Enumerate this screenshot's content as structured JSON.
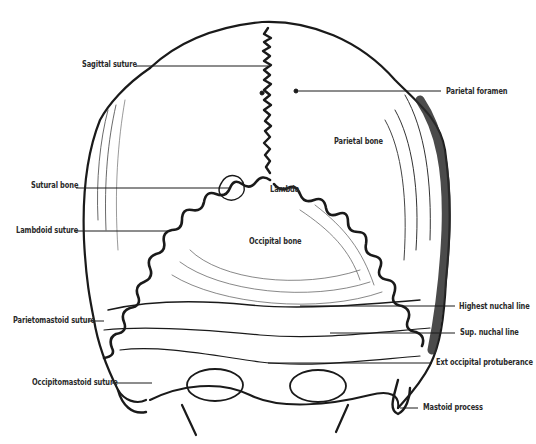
{
  "figure": {
    "colors": {
      "ink": "#1a1a1a",
      "background": "#ffffff",
      "label": "#2a2a2a"
    }
  },
  "labels": [
    {
      "id": "sagittal-suture",
      "text": "Sagittal suture",
      "x": 82,
      "y": 59,
      "side": "left",
      "leader": [
        [
          136,
          66
        ],
        [
          268,
          66
        ]
      ]
    },
    {
      "id": "parietal-foramen",
      "text": "Parietal foramen",
      "x": 446,
      "y": 86,
      "side": "right",
      "leader": [
        [
          299,
          91
        ],
        [
          441,
          91
        ]
      ]
    },
    {
      "id": "parietal-bone",
      "text": "Parietal bone",
      "x": 334,
      "y": 136,
      "side": "inline",
      "leader": []
    },
    {
      "id": "sutural-bone",
      "text": "Sutural bone",
      "x": 31,
      "y": 180,
      "side": "left",
      "leader": [
        [
          76,
          188
        ],
        [
          230,
          188
        ]
      ]
    },
    {
      "id": "lambda",
      "text": "Lambda",
      "x": 270,
      "y": 184,
      "side": "inline",
      "leader": []
    },
    {
      "id": "lambdoid-suture",
      "text": "Lambdoid suture",
      "x": 16,
      "y": 225,
      "side": "left",
      "leader": [
        [
          74,
          231
        ],
        [
          170,
          231
        ]
      ]
    },
    {
      "id": "occipital-bone",
      "text": "Occipital bone",
      "x": 249,
      "y": 236,
      "side": "inline",
      "leader": []
    },
    {
      "id": "highest-nuchal-line",
      "text": "Highest nuchal line",
      "x": 459,
      "y": 301,
      "side": "right",
      "leader": [
        [
          300,
          306
        ],
        [
          455,
          306
        ]
      ]
    },
    {
      "id": "parietomastoid-suture",
      "text": "Parietomastoid suture",
      "x": 13,
      "y": 315,
      "side": "left",
      "leader": [
        [
          88,
          321
        ],
        [
          104,
          321
        ]
      ]
    },
    {
      "id": "sup-nuchal-line",
      "text": "Sup. nuchal line",
      "x": 460,
      "y": 327,
      "side": "right",
      "leader": [
        [
          330,
          333
        ],
        [
          455,
          333
        ]
      ]
    },
    {
      "id": "ext-occipital-protuberance",
      "text": "Ext  occipital protuberance",
      "x": 436,
      "y": 357,
      "side": "right",
      "leader": [
        [
          268,
          363
        ],
        [
          432,
          363
        ]
      ]
    },
    {
      "id": "occipitomastoid-suture",
      "text": "Occipitomastoid suture",
      "x": 32,
      "y": 377,
      "side": "left",
      "leader": [
        [
          112,
          383
        ],
        [
          152,
          383
        ]
      ]
    },
    {
      "id": "mastoid-process",
      "text": "Mastoid process",
      "x": 423,
      "y": 402,
      "side": "right",
      "leader": [
        [
          400,
          408
        ],
        [
          418,
          408
        ]
      ]
    }
  ]
}
